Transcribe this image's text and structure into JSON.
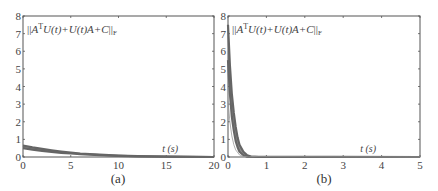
{
  "chart_data": [
    {
      "type": "line",
      "panel_label": "(a)",
      "title": "",
      "annotation": "||A^T U(t)+U(t)A+C||_F",
      "xlabel": "t (s)",
      "ylabel": "",
      "xlim": [
        0,
        20
      ],
      "ylim": [
        0,
        8
      ],
      "xticks": [
        0,
        5,
        10,
        15,
        20
      ],
      "yticks": [
        0,
        1,
        2,
        3,
        4,
        5,
        6,
        7,
        8
      ],
      "grid": false,
      "series": [
        {
          "name": "residual-upper",
          "x": [
            0,
            1,
            2,
            3,
            4,
            5,
            6,
            8,
            10,
            12,
            15,
            20
          ],
          "values": [
            0.65,
            0.55,
            0.46,
            0.38,
            0.31,
            0.25,
            0.2,
            0.13,
            0.08,
            0.05,
            0.02,
            0.0
          ]
        },
        {
          "name": "residual-lower",
          "x": [
            0,
            1,
            2,
            3,
            4,
            5,
            6,
            8,
            10,
            12,
            15,
            20
          ],
          "values": [
            0.5,
            0.42,
            0.35,
            0.29,
            0.24,
            0.2,
            0.16,
            0.1,
            0.06,
            0.04,
            0.02,
            0.0
          ]
        }
      ]
    },
    {
      "type": "line",
      "panel_label": "(b)",
      "title": "",
      "annotation": "||A^T U(t)+U(t)A+C||_F",
      "xlabel": "t (s)",
      "ylabel": "",
      "xlim": [
        0,
        5
      ],
      "ylim": [
        0,
        8
      ],
      "xticks": [
        0,
        1,
        2,
        3,
        4,
        5
      ],
      "yticks": [
        0,
        1,
        2,
        3,
        4,
        5,
        6,
        7,
        8
      ],
      "grid": false,
      "series": [
        {
          "name": "residual-upper",
          "x": [
            0,
            0.05,
            0.1,
            0.15,
            0.2,
            0.25,
            0.3,
            0.4,
            0.5,
            0.6,
            0.8,
            5
          ],
          "values": [
            7.5,
            5.2,
            3.6,
            2.5,
            1.7,
            1.1,
            0.7,
            0.3,
            0.1,
            0.03,
            0.0,
            0.0
          ]
        },
        {
          "name": "residual-lower",
          "x": [
            0,
            0.05,
            0.1,
            0.15,
            0.2,
            0.25,
            0.3,
            0.4,
            0.5,
            5
          ],
          "values": [
            5.5,
            3.6,
            2.3,
            1.5,
            0.9,
            0.55,
            0.3,
            0.1,
            0.02,
            0.0
          ]
        },
        {
          "name": "residual-thin",
          "x": [
            0,
            0.05,
            0.1,
            0.15,
            0.2,
            0.3,
            0.4,
            5
          ],
          "values": [
            3.2,
            2.0,
            1.2,
            0.7,
            0.4,
            0.12,
            0.03,
            0.0
          ]
        }
      ]
    }
  ],
  "labels": {
    "panel_a": "(a)",
    "panel_b": "(b)",
    "xlabel": "t (s)",
    "formula_norm_open": "||",
    "formula_A": "A",
    "formula_T": "T",
    "formula_body": "U(t)+U(t)A+C",
    "formula_norm_close": "||",
    "formula_sub": "F"
  },
  "colors": {
    "axis": "#555555",
    "curve": "#666666",
    "curve_thin": "#999999"
  }
}
